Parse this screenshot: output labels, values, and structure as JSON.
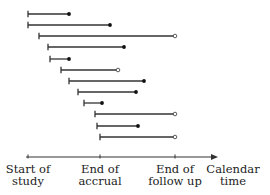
{
  "diagram": {
    "type": "study-timeline",
    "colors": {
      "line": "#333333",
      "marker_fill": "#111111",
      "open_fill": "#ffffff"
    },
    "axis": {
      "y": 157,
      "x_start": 26,
      "x_end": 218,
      "ticks": [
        {
          "x": 28,
          "label_line1": "Start of",
          "label_line2": "study"
        },
        {
          "x": 100,
          "label_line1": "End of",
          "label_line2": "accrual"
        },
        {
          "x": 175,
          "label_line1": "End of",
          "label_line2": "follow up"
        }
      ],
      "arrow_label_line1": "Calendar",
      "arrow_label_line2": "time",
      "arrow_label_x": 233
    },
    "subjects": [
      {
        "y": 14,
        "start": 28,
        "end": 69,
        "event": "filled"
      },
      {
        "y": 25,
        "start": 28,
        "end": 110,
        "event": "filled"
      },
      {
        "y": 36,
        "start": 39,
        "end": 175,
        "event": "open"
      },
      {
        "y": 47,
        "start": 48,
        "end": 124,
        "event": "filled"
      },
      {
        "y": 59,
        "start": 50,
        "end": 69,
        "event": "filled"
      },
      {
        "y": 70,
        "start": 61,
        "end": 118,
        "event": "open"
      },
      {
        "y": 81,
        "start": 69,
        "end": 144,
        "event": "filled"
      },
      {
        "y": 92,
        "start": 78,
        "end": 136,
        "event": "filled"
      },
      {
        "y": 103,
        "start": 84,
        "end": 102,
        "event": "filled"
      },
      {
        "y": 114,
        "start": 95,
        "end": 175,
        "event": "open"
      },
      {
        "y": 126,
        "start": 97,
        "end": 138,
        "event": "filled"
      },
      {
        "y": 137,
        "start": 100,
        "end": 175,
        "event": "open"
      }
    ]
  }
}
